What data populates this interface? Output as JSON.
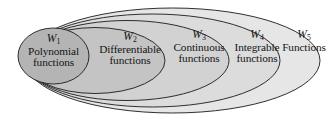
{
  "diagram": {
    "type": "nested-ellipses-venn",
    "background_color": "#ffffff",
    "stroke_color": "#1a1a1a",
    "regions": [
      {
        "id": "w1",
        "set_name": "W",
        "subscript": "1",
        "description_line1": "Polynomial",
        "description_line2": "functions",
        "fill_color": "#b4b4b4"
      },
      {
        "id": "w2",
        "set_name": "W",
        "subscript": "2",
        "description_line1": "Differentiable",
        "description_line2": "functions",
        "fill_color": "#c4c4c4"
      },
      {
        "id": "w3",
        "set_name": "W",
        "subscript": "3",
        "description_line1": "Continuous",
        "description_line2": "functions",
        "fill_color": "#d2d2d2"
      },
      {
        "id": "w4",
        "set_name": "W",
        "subscript": "4",
        "description_line1": "Integrable",
        "description_line2": "functions",
        "fill_color": "#dcdcdc"
      },
      {
        "id": "w5",
        "set_name": "W",
        "subscript": "5",
        "description_line1": "Functions",
        "description_line2": "",
        "fill_color": "#e6e6e6"
      }
    ]
  }
}
